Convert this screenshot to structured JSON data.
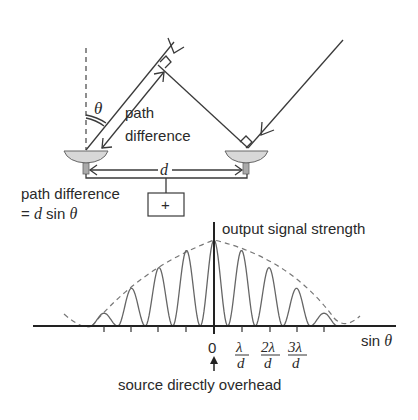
{
  "top_diagram": {
    "angle_label": "θ",
    "path_difference_label_line1": "path",
    "path_difference_label_line2": "difference",
    "separation_label": "d",
    "formula_line1": "path difference",
    "formula_line2_prefix": "= ",
    "formula_line2_d": "d",
    "formula_line2_rest": " sin ",
    "formula_line2_theta": "θ",
    "combiner_symbol": "+",
    "dishes": [
      "left-dish",
      "right-dish"
    ]
  },
  "chart_data": {
    "type": "line",
    "title": "output signal strength",
    "xlabel": "sin θ",
    "ylabel": "output signal strength",
    "x_tick_labels": [
      {
        "num": "0",
        "den": ""
      },
      {
        "num": "λ",
        "den": "d"
      },
      {
        "num": "2λ",
        "den": "d"
      },
      {
        "num": "3λ",
        "den": "d"
      }
    ],
    "annotation": "source directly overhead",
    "series": [
      {
        "name": "interference fringes",
        "style": "solid",
        "x": [
          -4,
          -3,
          -2,
          -1,
          0,
          1,
          2,
          3,
          4
        ],
        "values": [
          0.15,
          0.44,
          0.68,
          0.88,
          1.0,
          0.88,
          0.68,
          0.44,
          0.15
        ]
      },
      {
        "name": "single-dish envelope",
        "style": "dashed",
        "description": "broad beam envelope bounding fringe peaks"
      }
    ],
    "grid": false,
    "legend": "none"
  }
}
